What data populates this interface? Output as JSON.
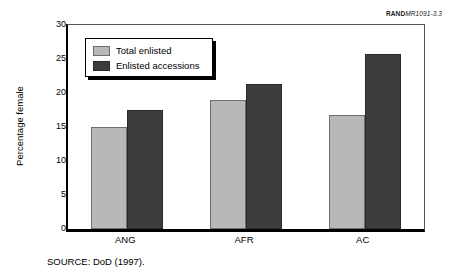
{
  "header": {
    "rand_id_bold": "RAND",
    "rand_id_italic": "MR1091-3.3"
  },
  "footer": {
    "source": "SOURCE:  DoD (1997)."
  },
  "legend": {
    "position": "inside-top-left",
    "entries": [
      {
        "label": "Total enlisted",
        "color": "#b8b8b8"
      },
      {
        "label": "Enlisted accessions",
        "color": "#3d3d3d"
      }
    ]
  },
  "axes": {
    "ylabel": "Percentage female",
    "yticks": [
      "0",
      "5",
      "10",
      "15",
      "20",
      "25",
      "30"
    ],
    "xticks": [
      "ANG",
      "AFR",
      "AC"
    ]
  },
  "chart_data": {
    "type": "bar",
    "title": "",
    "subtitle": "",
    "xlabel": "",
    "ylabel": "Percentage female",
    "categories": [
      "ANG",
      "AFR",
      "AC"
    ],
    "series": [
      {
        "name": "Total enlisted",
        "color": "#b8b8b8",
        "values": [
          15.0,
          19.0,
          16.8
        ]
      },
      {
        "name": "Enlisted accessions",
        "color": "#3d3d3d",
        "values": [
          17.5,
          21.3,
          25.8
        ]
      }
    ],
    "ylim": [
      0,
      30
    ],
    "ytick_step": 5,
    "grid": false,
    "legend_position": "upper left (inside plot)",
    "annotations": [
      "RANDMR1091-3.3",
      "SOURCE:  DoD (1997)."
    ]
  }
}
